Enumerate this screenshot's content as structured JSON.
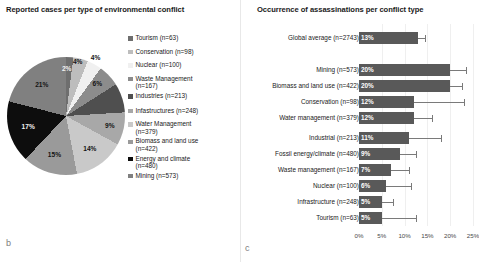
{
  "panel_b": {
    "title": "Reported cases per type of environmental conflict",
    "figure_label": "b"
  },
  "panel_c": {
    "title": "Occurrence of assassinations per conflict type",
    "figure_label": "c"
  },
  "colors": {
    "bar_fill": "#595959",
    "error_bar": "#7a7a7a",
    "gridline": "#efefef",
    "text": "#1a1a1a"
  },
  "chart_data": [
    {
      "type": "pie",
      "title": "Reported cases per type of environmental conflict",
      "xlabel": "",
      "ylabel": "",
      "legend_position": "right",
      "grid": false,
      "categories": [
        "Tourism (n=63)",
        "Conservation (n=98)",
        "Nuclear (n=100)",
        "Waste Management (n=167)",
        "Industries (n=213)",
        "Infastructures (n=248)",
        "Water Management (n=379)",
        "Biomass and land use (n=422)",
        "Energy and climate (n=480)",
        "Mining (n=573)"
      ],
      "labels": [
        "Tourism",
        "Conservation",
        "Nuclear",
        "Waste Management",
        "Industries",
        "Infastructures",
        "Water Management",
        "Biomass and land use",
        "Energy and climate",
        "Mining"
      ],
      "counts": [
        63,
        98,
        100,
        167,
        213,
        248,
        379,
        422,
        480,
        573
      ],
      "values": [
        2,
        4,
        4,
        6,
        8,
        9,
        14,
        15,
        17,
        21
      ],
      "data_labels": [
        "2%",
        "4%",
        "4%",
        "6%",
        "",
        "9%",
        "14%",
        "15%",
        "17%",
        "21%"
      ],
      "slice_colors": [
        "#6e6e6e",
        "#bdbdbd",
        "#f0f0f0",
        "#8c8c8c",
        "#4f4f4f",
        "#a8a8a8",
        "#c9c9c9",
        "#9a9a9a",
        "#0d0d0d",
        "#808080"
      ]
    },
    {
      "type": "bar",
      "orientation": "horizontal",
      "title": "Occurrence of assassinations per conflict type",
      "xlabel": "",
      "ylabel": "",
      "xlim": [
        0,
        25
      ],
      "grid": true,
      "legend_position": "none",
      "xticks": [
        "0%",
        "5%",
        "10%",
        "15%",
        "20%",
        "25%"
      ],
      "xtick_values": [
        0,
        5,
        10,
        15,
        20,
        25
      ],
      "categories": [
        "Global average (n=2743)",
        "Mining (n=573)",
        "Biomass and land use (n=422)",
        "Conservation (n=98)",
        "Water management (n=379)",
        "Industrial (n=213)",
        "Fossil energy/climate (n=480)",
        "Waste management (n=167)",
        "Nuclear (n=100)",
        "Infrastructure (n=248)",
        "Tourism (n=63)"
      ],
      "counts": [
        2743,
        573,
        422,
        98,
        379,
        213,
        480,
        167,
        100,
        248,
        63
      ],
      "values": [
        13,
        20,
        20,
        12,
        12,
        11,
        9,
        7,
        6,
        5,
        5
      ],
      "data_labels": [
        "13%",
        "20%",
        "20%",
        "12%",
        "12%",
        "11%",
        "9%",
        "7%",
        "6%",
        "5%",
        "5%"
      ],
      "error_upper": [
        14.5,
        23.5,
        22.5,
        23.0,
        16.0,
        18.0,
        12.5,
        11.0,
        11.5,
        7.5,
        12.5
      ]
    }
  ]
}
